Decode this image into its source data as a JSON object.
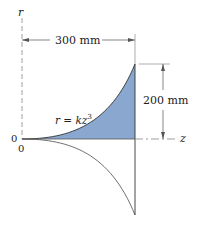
{
  "diagram": {
    "axes": {
      "r_label": "r",
      "z_label": "z",
      "origin_label_left": "0",
      "origin_label_below": "0"
    },
    "dimensions": {
      "width_label": "300 mm",
      "height_label": "200 mm"
    },
    "curve": {
      "equation_prefix": "r = kz",
      "equation_exponent": "3"
    },
    "colors": {
      "fill": "#8aa8cf",
      "line": "#333333",
      "axis": "#666666",
      "background": "#ffffff"
    }
  }
}
